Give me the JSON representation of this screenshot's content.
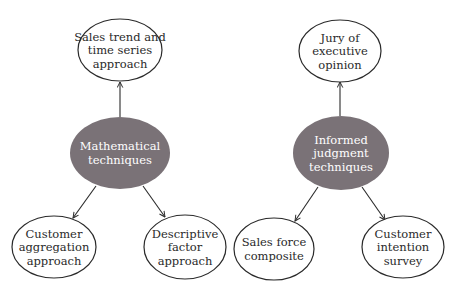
{
  "colors": {
    "hub_fill": "#7a7277",
    "stroke": "#2a2a2a",
    "background": "#ffffff"
  },
  "groups": [
    {
      "hub": {
        "lines": [
          "Mathematical",
          "techniques"
        ],
        "cx": 120,
        "cy": 153,
        "rx": 50,
        "ry": 36
      },
      "children": [
        {
          "position": "top",
          "lines": [
            "Sales trend and",
            "time series",
            "approach"
          ],
          "cx": 120,
          "cy": 50,
          "rx": 42,
          "ry": 31
        },
        {
          "position": "bottom-left",
          "lines": [
            "Customer",
            "aggregation",
            "approach"
          ],
          "cx": 54,
          "cy": 247,
          "rx": 42,
          "ry": 31
        },
        {
          "position": "bottom-right",
          "lines": [
            "Descriptive",
            "factor",
            "approach"
          ],
          "cx": 185,
          "cy": 247,
          "rx": 41,
          "ry": 32
        }
      ]
    },
    {
      "hub": {
        "lines": [
          "Informed",
          "judgment",
          "techniques"
        ],
        "cx": 341,
        "cy": 153,
        "rx": 48,
        "ry": 37
      },
      "children": [
        {
          "position": "top",
          "lines": [
            "Jury of",
            "executive",
            "opinion"
          ],
          "cx": 340,
          "cy": 51,
          "rx": 41,
          "ry": 31
        },
        {
          "position": "bottom-left",
          "lines": [
            "Sales force",
            "composite"
          ],
          "cx": 274,
          "cy": 249,
          "rx": 40,
          "ry": 31
        },
        {
          "position": "bottom-right",
          "lines": [
            "Customer",
            "intention",
            "survey"
          ],
          "cx": 403,
          "cy": 247,
          "rx": 41,
          "ry": 31
        }
      ]
    }
  ],
  "arrows": [
    {
      "from": "Mathematical techniques",
      "to": "Sales trend and time series approach",
      "x1": 120,
      "y1": 117,
      "x2": 120,
      "y2": 82
    },
    {
      "from": "Mathematical techniques",
      "to": "Customer aggregation approach",
      "x1": 96,
      "y1": 186,
      "x2": 73,
      "y2": 218
    },
    {
      "from": "Mathematical techniques",
      "to": "Descriptive factor approach",
      "x1": 143,
      "y1": 186,
      "x2": 165,
      "y2": 217
    },
    {
      "from": "Informed judgment techniques",
      "to": "Jury of executive opinion",
      "x1": 340,
      "y1": 116,
      "x2": 340,
      "y2": 82
    },
    {
      "from": "Informed judgment techniques",
      "to": "Sales force composite",
      "x1": 318,
      "y1": 187,
      "x2": 295,
      "y2": 221
    },
    {
      "from": "Informed judgment techniques",
      "to": "Customer intention survey",
      "x1": 362,
      "y1": 187,
      "x2": 385,
      "y2": 220
    }
  ]
}
